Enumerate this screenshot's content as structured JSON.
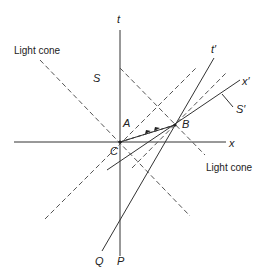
{
  "diagram": {
    "type": "spacetime (Minkowski) diagram",
    "colors": {
      "line": "#333333",
      "dashed": "#555555",
      "background": "#ffffff"
    },
    "axes": {
      "t": "t",
      "x": "x",
      "t_prime": "t′",
      "x_prime": "x′"
    },
    "frames": {
      "S": "S",
      "S_prime": "S′"
    },
    "events": {
      "A": "A",
      "B": "B",
      "C": "C"
    },
    "worldlines": {
      "P": "P",
      "Q": "Q"
    },
    "annotations": {
      "light_cone_top": "Light cone",
      "light_cone_bottom": "Light cone"
    }
  }
}
